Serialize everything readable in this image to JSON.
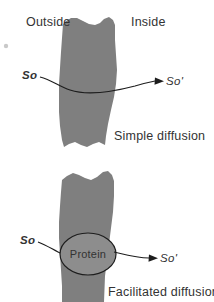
{
  "figure": {
    "title_caption_top": "Simple diffusion",
    "title_caption_bottom": "Facilitated diffusion",
    "width": 214,
    "height": 302,
    "background_color": "#ffffff"
  },
  "colors": {
    "membrane": "#7f7f7f",
    "protein_fill": "#8d8d8d",
    "line": "#1d1d1d",
    "text": "#333333"
  },
  "panels": [
    {
      "id": "simple-diffusion",
      "caption": "Simple diffusion",
      "side_labels": {
        "left": "Outside",
        "right": "Inside"
      },
      "solute_in": "So",
      "solute_out": "So'",
      "has_protein": false
    },
    {
      "id": "facilitated-diffusion",
      "caption": "Facilitated diffusion",
      "side_labels": {
        "left": "",
        "right": ""
      },
      "solute_in": "So",
      "solute_out": "So'",
      "has_protein": true,
      "protein_label": "Protein"
    }
  ],
  "labels": {
    "outside": "Outside",
    "inside": "Inside",
    "protein": "Protein",
    "solute_outside_top": "So",
    "solute_inside_top": "So'",
    "solute_outside_bottom": "So",
    "solute_inside_bottom": "So'",
    "caption_top": "Simple diffusion",
    "caption_bottom": "Facilitated diffusion"
  }
}
